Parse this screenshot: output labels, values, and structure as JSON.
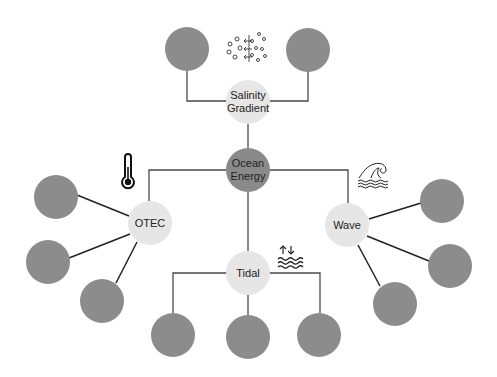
{
  "diagram": {
    "title": "Ocean Energy",
    "colors": {
      "background": "#ffffff",
      "hub_fill": "#8a8a8a",
      "category_fill": "#e6e6e6",
      "leaf_fill": "#8c8c8c",
      "line": "#4a4a4a"
    },
    "hub": {
      "label_line1": "Ocean",
      "label_line2": "Energy"
    },
    "categories": {
      "salinity": {
        "label_line1": "Salinity",
        "label_line2": "Gradient",
        "icon": "salinity-diffusion-icon",
        "leaf_count": 2
      },
      "otec": {
        "label": "OTEC",
        "icon": "thermometer-icon",
        "leaf_count": 3
      },
      "wave": {
        "label": "Wave",
        "icon": "ocean-wave-icon",
        "leaf_count": 3
      },
      "tidal": {
        "label": "Tidal",
        "icon": "tide-arrows-waves-icon",
        "leaf_count": 3
      }
    }
  }
}
